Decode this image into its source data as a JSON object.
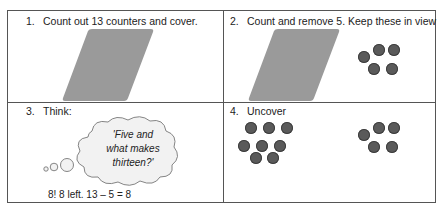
{
  "steps": [
    {
      "number": "1.",
      "text": "Count out 13 counters and cover."
    },
    {
      "number": "2.",
      "text": "Count and remove 5. Keep these in view"
    },
    {
      "number": "3.",
      "text": "Think:"
    },
    {
      "number": "4.",
      "text": "Uncover"
    }
  ],
  "thought_bubble": {
    "line1": "'Five and",
    "line2": "what makes",
    "line3": "thirteen?'"
  },
  "answer": "8! 8 left. 13 – 5 = 8",
  "counters": {
    "removed_count": 5,
    "remaining_count": 8,
    "color": "#5a5a5a"
  },
  "cover_color": "#9a9a9a"
}
